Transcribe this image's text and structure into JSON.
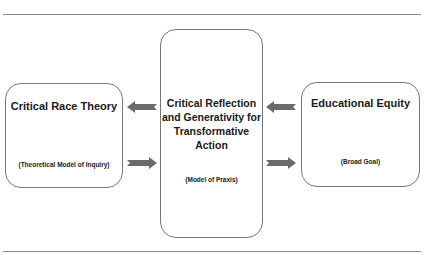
{
  "diagram": {
    "left_box": {
      "title": "Critical Race Theory",
      "subtitle": "(Theoretical Model of Inquiry)"
    },
    "center_box": {
      "title": "Critical Reflection and Generativity for Transformative Action",
      "subtitle": "(Model of Praxis)"
    },
    "right_box": {
      "title": "Educational Equity",
      "subtitle": "(Broad Goal)"
    },
    "arrows": [
      {
        "from": "center",
        "to": "left",
        "direction": "left"
      },
      {
        "from": "left",
        "to": "center",
        "direction": "right"
      },
      {
        "from": "right",
        "to": "center",
        "direction": "left"
      },
      {
        "from": "center",
        "to": "right",
        "direction": "right"
      }
    ],
    "colors": {
      "arrow": "#6b6b6b",
      "border": "#777777",
      "rule": "#8a8a8a"
    }
  }
}
